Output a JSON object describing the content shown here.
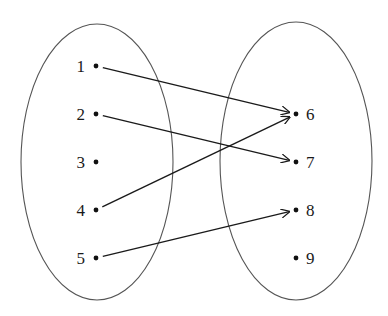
{
  "diagram": {
    "type": "mapping",
    "domain_set": {
      "label": "domain",
      "ellipse": {
        "cx": 97,
        "cy": 162,
        "rx": 76,
        "ry": 138
      },
      "elements": [
        {
          "label": "1",
          "x": 96,
          "y": 66
        },
        {
          "label": "2",
          "x": 96,
          "y": 114
        },
        {
          "label": "3",
          "x": 96,
          "y": 162
        },
        {
          "label": "4",
          "x": 96,
          "y": 210
        },
        {
          "label": "5",
          "x": 96,
          "y": 258
        }
      ]
    },
    "codomain_set": {
      "label": "codomain",
      "ellipse": {
        "cx": 296,
        "cy": 161,
        "rx": 76,
        "ry": 139
      },
      "elements": [
        {
          "label": "6",
          "x": 296,
          "y": 114
        },
        {
          "label": "7",
          "x": 296,
          "y": 162
        },
        {
          "label": "8",
          "x": 296,
          "y": 210
        },
        {
          "label": "9",
          "x": 296,
          "y": 258
        }
      ]
    },
    "mappings": [
      {
        "from": "1",
        "to": "6"
      },
      {
        "from": "2",
        "to": "7"
      },
      {
        "from": "4",
        "to": "6"
      },
      {
        "from": "5",
        "to": "8"
      }
    ],
    "colors": {
      "ellipse_stroke": "#555555",
      "arrow": "#1a1a1a",
      "dot": "#111111",
      "text": "#1a1a1a"
    }
  }
}
